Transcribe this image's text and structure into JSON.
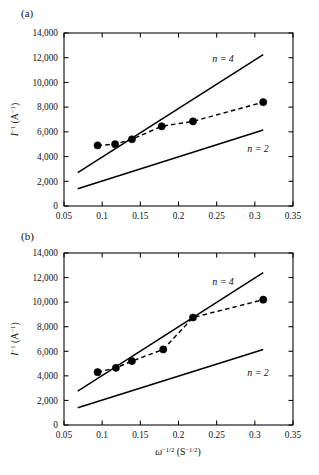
{
  "figure": {
    "panels": [
      {
        "id": "a",
        "label": "(a)"
      },
      {
        "id": "b",
        "label": "(b)"
      }
    ]
  },
  "axes": {
    "x": {
      "title_parts": {
        "symbol": "ω",
        "symbol_sup": "−1/2",
        "unit_open": " (S",
        "unit_sup": "−1/2",
        "unit_close": ")"
      },
      "title_plain": "ω⁻¹ᐟ² (S⁻¹ᐟ²)",
      "min": 0.05,
      "max": 0.35,
      "tick_values": [
        0.05,
        0.1,
        0.15,
        0.2,
        0.25,
        0.3,
        0.35
      ],
      "tick_labels": [
        "0.05",
        "0.1",
        "0.15",
        "0.2",
        "0.25",
        "0.3",
        "0.35"
      ]
    },
    "y": {
      "title_parts": {
        "symbol": "I",
        "symbol_sup": "−1",
        "unit_open": " (A",
        "unit_sup": "−1",
        "unit_close": ")"
      },
      "title_plain": "I⁻¹ (A⁻¹)",
      "min": 0,
      "max": 14000,
      "tick_values": [
        0,
        2000,
        4000,
        6000,
        8000,
        10000,
        12000,
        14000
      ],
      "tick_labels": [
        "0",
        "2,000",
        "4,000",
        "6,000",
        "8,000",
        "10,000",
        "12,000",
        "14,000"
      ]
    }
  },
  "annotations": {
    "n4": "n = 4",
    "n2": "n = 2"
  },
  "colors": {
    "axis": "#000000",
    "marker": "#000000",
    "line": "#000000",
    "background": "#ffffff"
  },
  "chart_data": [
    {
      "type": "scatter",
      "panel": "a",
      "title": "(a)",
      "xlabel": "ω⁻¹ᐟ² (S⁻¹ᐟ²)",
      "ylabel": "I⁻¹ (A⁻¹)",
      "xlim": [
        0.05,
        0.35
      ],
      "ylim": [
        0,
        14000
      ],
      "grid": false,
      "legend": "none",
      "series": [
        {
          "name": "experimental",
          "style": "markers-with-dashed-fit",
          "x": [
            0.094,
            0.117,
            0.139,
            0.178,
            0.219,
            0.311
          ],
          "values": [
            4900,
            5000,
            5400,
            6450,
            6850,
            8400
          ]
        },
        {
          "name": "n = 4",
          "style": "solid-line",
          "x": [
            0.068,
            0.311
          ],
          "values": [
            2700,
            12250
          ]
        },
        {
          "name": "n = 2",
          "style": "solid-line",
          "x": [
            0.068,
            0.311
          ],
          "values": [
            1400,
            6150
          ]
        }
      ]
    },
    {
      "type": "scatter",
      "panel": "b",
      "title": "(b)",
      "xlabel": "ω⁻¹ᐟ² (S⁻¹ᐟ²)",
      "ylabel": "I⁻¹ (A⁻¹)",
      "xlim": [
        0.05,
        0.35
      ],
      "ylim": [
        0,
        14000
      ],
      "grid": false,
      "legend": "none",
      "series": [
        {
          "name": "experimental",
          "style": "markers-with-dashed-fit",
          "x": [
            0.094,
            0.118,
            0.139,
            0.18,
            0.219,
            0.311
          ],
          "values": [
            4300,
            4650,
            5200,
            6150,
            8750,
            10200
          ]
        },
        {
          "name": "n = 4",
          "style": "solid-line",
          "x": [
            0.068,
            0.311
          ],
          "values": [
            2750,
            12400
          ]
        },
        {
          "name": "n = 2",
          "style": "solid-line",
          "x": [
            0.068,
            0.311
          ],
          "values": [
            1400,
            6150
          ]
        }
      ]
    }
  ]
}
